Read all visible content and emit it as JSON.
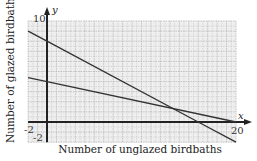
{
  "chart_data": {
    "type": "line",
    "title": "",
    "xlabel": "Number of unglazed birdbaths",
    "ylabel": "Number of glazed birdbaths",
    "x_axis_name": "x",
    "y_axis_name": "y",
    "xlim": [
      -2,
      20
    ],
    "ylim": [
      -2,
      10
    ],
    "grid": true,
    "tick_labels": {
      "x_min": "-2",
      "x_max": "20",
      "y_min": "-2",
      "y_max": "10"
    },
    "series": [
      {
        "name": "steep line",
        "points": [
          [
            -2,
            9
          ],
          [
            0,
            8
          ],
          [
            16,
            0
          ],
          [
            20,
            -2
          ]
        ],
        "equation": "y = 8 - 0.5x"
      },
      {
        "name": "shallow line",
        "points": [
          [
            -2,
            4.4
          ],
          [
            0,
            4
          ],
          [
            20,
            0
          ]
        ],
        "equation": "y = 4 - 0.2x"
      }
    ],
    "intersection": [
      13.33,
      1.33
    ]
  },
  "colors": {
    "grid": "#b5b5b5",
    "background": "#efefef",
    "axis": "#222222",
    "line": "#333333"
  }
}
